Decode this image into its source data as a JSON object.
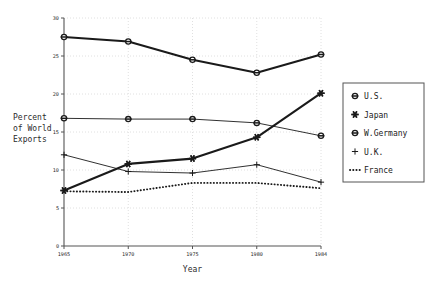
{
  "chart_data": {
    "type": "line",
    "title": "",
    "xlabel": "Year",
    "ylabel": "Percent of World Exports",
    "ylabel_lines": [
      "Percent",
      "of World",
      "Exports"
    ],
    "x": [
      1965,
      1970,
      1975,
      1980,
      1984
    ],
    "xtick_labels": [
      "1965",
      "1970",
      "1975",
      "1980",
      "1984"
    ],
    "ytick_labels": [
      "0",
      "5",
      "10",
      "15",
      "20",
      "25",
      "30"
    ],
    "yticks": [
      0,
      5,
      10,
      15,
      20,
      25,
      30
    ],
    "ylim": [
      0,
      30
    ],
    "xlim": [
      1965,
      1984
    ],
    "grid": "dotted-light",
    "legend_position": "right-outside",
    "series": [
      {
        "name": "U.S.",
        "marker": "circle-bar",
        "line": "solid-thick",
        "values": [
          27.5,
          26.9,
          24.5,
          22.8,
          25.2
        ]
      },
      {
        "name": "Japan",
        "marker": "star",
        "line": "solid-thick",
        "values": [
          7.3,
          10.8,
          11.5,
          14.3,
          20.1
        ]
      },
      {
        "name": "W.Germany",
        "marker": "circle-dot",
        "line": "solid-thin",
        "values": [
          16.8,
          16.7,
          16.7,
          16.2,
          14.5
        ]
      },
      {
        "name": "U.K.",
        "marker": "plus",
        "line": "solid-thin",
        "values": [
          12.0,
          9.8,
          9.6,
          10.7,
          8.4
        ]
      },
      {
        "name": "France",
        "marker": "none",
        "line": "dotted-thick",
        "values": [
          7.2,
          7.1,
          8.3,
          8.3,
          7.6
        ]
      }
    ]
  },
  "legend": {
    "entries": [
      {
        "label": "U.S."
      },
      {
        "label": "Japan"
      },
      {
        "label": "W.Germany"
      },
      {
        "label": "U.K."
      },
      {
        "label": "France"
      }
    ]
  },
  "colors": {
    "ink": "#1a1a1a",
    "grid": "#d8d8d8",
    "axis": "#555555",
    "background": "#ffffff"
  }
}
